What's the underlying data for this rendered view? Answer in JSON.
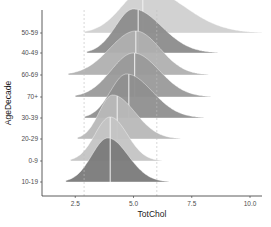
{
  "chart_data": {
    "type": "ridgeline",
    "title": "",
    "xlabel": "TotChol",
    "ylabel": "AgeDecade",
    "xlim": [
      1.1,
      10.5
    ],
    "x_ticks": [
      2.5,
      5.0,
      7.5,
      10.0
    ],
    "x_tick_labels": [
      "2.5",
      "5.0",
      "7.5",
      "10.0"
    ],
    "categories": [
      "50-59",
      "40-49",
      "60-69",
      "70+",
      "30-39",
      "20-29",
      "0-9",
      "10-19"
    ],
    "reference_lines": [
      {
        "x": 2.88,
        "style": "dashed"
      },
      {
        "x": 6.0,
        "style": "dashed"
      }
    ],
    "grid": false,
    "legend": "none",
    "series": [
      {
        "name": "50-59",
        "color": "#d0d0d0",
        "median": 5.4,
        "range": [
          2.9,
          10.5
        ],
        "peak": 5.5
      },
      {
        "name": "40-49",
        "color": "#8c8c8c",
        "median": 5.2,
        "range": [
          3.0,
          8.6
        ],
        "peak": 5.0
      },
      {
        "name": "60-69",
        "color": "#b0b0b0",
        "median": 5.1,
        "range": [
          2.2,
          8.2
        ],
        "peak": 5.1
      },
      {
        "name": "70+",
        "color": "#9a9a9a",
        "median": 5.05,
        "range": [
          2.5,
          8.3
        ],
        "peak": 5.0
      },
      {
        "name": "30-39",
        "color": "#8f8f8f",
        "median": 4.8,
        "range": [
          2.9,
          8.0
        ],
        "peak": 4.7
      },
      {
        "name": "20-29",
        "color": "#b8b8b8",
        "median": 4.3,
        "range": [
          2.6,
          7.0
        ],
        "peak": 4.1
      },
      {
        "name": "0-9",
        "color": "#c4c4c4",
        "median": 4.0,
        "range": [
          2.3,
          6.2
        ],
        "peak": 4.0
      },
      {
        "name": "10-19",
        "color": "#7a7a7a",
        "median": 4.0,
        "range": [
          2.1,
          6.5
        ],
        "peak": 3.9
      }
    ]
  }
}
